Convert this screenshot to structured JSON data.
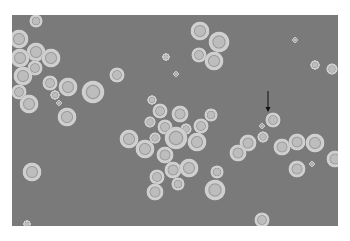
{
  "image": {
    "description": "Phase-contrast micrograph of round cells (halo-bordered) on gray background with an arrow indicating one cell",
    "colors": {
      "background": "#ffffff",
      "field": "#7a7a7a",
      "halo": "#cfcfcf",
      "ring": "#9a9a9a",
      "center": "#bdbdbd",
      "arrow": "#111111"
    },
    "field": {
      "x": 12,
      "y": 15,
      "w": 326,
      "h": 211
    },
    "arrow": {
      "x": 268,
      "y1": 91,
      "y2": 112,
      "target": [
        273,
        120
      ]
    },
    "cells": [
      [
        36,
        21,
        7
      ],
      [
        19,
        39,
        10
      ],
      [
        36,
        52,
        10
      ],
      [
        20,
        58,
        10
      ],
      [
        51,
        58,
        10
      ],
      [
        35,
        68,
        8
      ],
      [
        23,
        76,
        10
      ],
      [
        50,
        83,
        8
      ],
      [
        19,
        92,
        8
      ],
      [
        68,
        87,
        10
      ],
      [
        93,
        92,
        12
      ],
      [
        55,
        95,
        5
      ],
      [
        59,
        103,
        3
      ],
      [
        29,
        104,
        10
      ],
      [
        67,
        117,
        10
      ],
      [
        117,
        75,
        8
      ],
      [
        200,
        31,
        10
      ],
      [
        219,
        42,
        11
      ],
      [
        199,
        55,
        8
      ],
      [
        214,
        61,
        10
      ],
      [
        166,
        57,
        4
      ],
      [
        176,
        74,
        3
      ],
      [
        295,
        40,
        3
      ],
      [
        315,
        65,
        5
      ],
      [
        332,
        69,
        6
      ],
      [
        152,
        100,
        5
      ],
      [
        160,
        111,
        8
      ],
      [
        180,
        114,
        9
      ],
      [
        211,
        115,
        7
      ],
      [
        150,
        122,
        6
      ],
      [
        165,
        127,
        8
      ],
      [
        186,
        129,
        6
      ],
      [
        201,
        126,
        8
      ],
      [
        129,
        139,
        10
      ],
      [
        155,
        138,
        6
      ],
      [
        176,
        138,
        12
      ],
      [
        197,
        142,
        10
      ],
      [
        145,
        149,
        10
      ],
      [
        165,
        155,
        9
      ],
      [
        173,
        170,
        9
      ],
      [
        189,
        168,
        10
      ],
      [
        157,
        177,
        8
      ],
      [
        217,
        172,
        7
      ],
      [
        178,
        184,
        7
      ],
      [
        215,
        190,
        11
      ],
      [
        155,
        192,
        9
      ],
      [
        273,
        120,
        8
      ],
      [
        262,
        126,
        3
      ],
      [
        263,
        137,
        6
      ],
      [
        248,
        143,
        9
      ],
      [
        238,
        153,
        9
      ],
      [
        282,
        147,
        9
      ],
      [
        297,
        142,
        9
      ],
      [
        315,
        143,
        10
      ],
      [
        312,
        164,
        3
      ],
      [
        297,
        169,
        9
      ],
      [
        335,
        159,
        9
      ],
      [
        262,
        220,
        8
      ],
      [
        32,
        172,
        10
      ],
      [
        27,
        224,
        4
      ]
    ]
  }
}
